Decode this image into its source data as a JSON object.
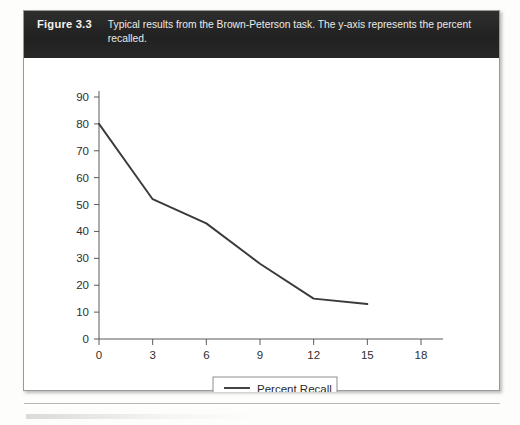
{
  "figure": {
    "number": "Figure 3.3",
    "caption": "Typical results from the Brown-Peterson task. The y-axis represents the percent recalled."
  },
  "chart_data": {
    "type": "line",
    "title": "",
    "xlabel": "",
    "ylabel": "",
    "x": [
      0,
      3,
      6,
      9,
      12,
      15
    ],
    "series": [
      {
        "name": "Percent Recall",
        "values": [
          80,
          52,
          43,
          28,
          15,
          13
        ]
      }
    ],
    "xlim": [
      0,
      18
    ],
    "ylim": [
      0,
      90
    ],
    "xticks": [
      "0",
      "3",
      "6",
      "9",
      "12",
      "15",
      "18"
    ],
    "yticks": [
      "0",
      "10",
      "20",
      "30",
      "40",
      "50",
      "60",
      "70",
      "80",
      "90"
    ],
    "grid": false,
    "legend_position": "bottom",
    "line_color": "#3a3a3a"
  },
  "legend": {
    "entries": [
      {
        "label": "Percent Recall",
        "swatch": "line-swatch-icon"
      }
    ]
  }
}
